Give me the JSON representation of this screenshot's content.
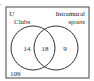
{
  "diagram": {
    "type": "venn",
    "universe_label": "U",
    "sets": [
      {
        "name": "Clubs",
        "label": "Clubs"
      },
      {
        "name": "Intramural sports",
        "label_line1": "Intramural",
        "label_line2": "sports"
      }
    ],
    "regions": {
      "clubs_only": "14",
      "both": "18",
      "sports_only": "9",
      "neither": "109"
    },
    "colors": {
      "stroke": "#333333",
      "background": "#ffffff"
    }
  }
}
